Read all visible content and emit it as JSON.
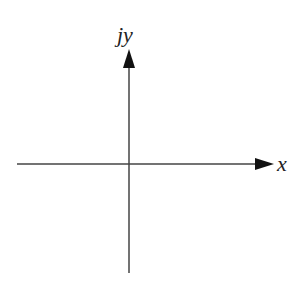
{
  "diagram": {
    "type": "complex-plane-axes",
    "labels": {
      "x_axis": "x",
      "y_axis": "jy"
    },
    "colors": {
      "axis": "#444444",
      "background": "#ffffff"
    }
  }
}
